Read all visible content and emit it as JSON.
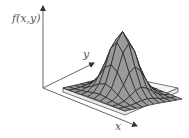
{
  "diagram": {
    "type": "3d-surface-plot",
    "axes": {
      "vertical_label": "f(x,y)",
      "y_label": "y",
      "x_label": "x"
    },
    "colors": {
      "surface_fill": "#9a9a9a",
      "mesh_lines": "#222222",
      "axis": "#555555",
      "base": "#f4f4f4"
    },
    "mesh": {
      "rows": 10,
      "cols": 10
    }
  }
}
